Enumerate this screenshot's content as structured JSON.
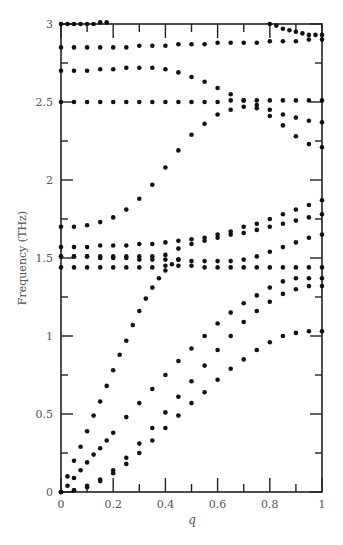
{
  "chart_data": {
    "type": "scatter",
    "title": "",
    "xlabel": "q",
    "ylabel": "Frequency (THz)",
    "xlim": [
      0,
      1
    ],
    "ylim": [
      0,
      3
    ],
    "grid": false,
    "legend": null,
    "x_ticks": [
      0,
      0.2,
      0.4,
      0.6,
      0.8,
      1
    ],
    "x_tick_labels": [
      "0",
      "0.2",
      "0.4",
      "0.6",
      "0.8",
      "1"
    ],
    "x_minor_ticks": [
      0.1,
      0.3,
      0.5,
      0.7,
      0.9
    ],
    "y_ticks": [
      0,
      0.5,
      1,
      1.5,
      2,
      2.5,
      3
    ],
    "y_tick_labels": [
      "0",
      "0.5",
      "1",
      "1.5",
      "2",
      "2.5",
      "3"
    ],
    "y_minor_ticks": [
      0.25,
      0.75,
      1.25,
      1.75,
      2.25,
      2.75
    ],
    "marker_color": "#111111",
    "series": [
      {
        "name": "branch-1",
        "x": [
          0,
          0.025,
          0.05,
          0.075,
          0.1,
          0.125,
          0.15,
          0.175
        ],
        "y": [
          3.0,
          3.0,
          3.0,
          3.0,
          3.0,
          3.0,
          3.01,
          3.01
        ]
      },
      {
        "name": "branch-2",
        "x": [
          0.8,
          0.825,
          0.85,
          0.875,
          0.9,
          0.925,
          0.95,
          0.975,
          1.0
        ],
        "y": [
          3.0,
          2.99,
          2.97,
          2.96,
          2.95,
          2.94,
          2.93,
          2.93,
          2.93
        ]
      },
      {
        "name": "branch-3",
        "x": [
          0,
          0.05,
          0.1,
          0.15,
          0.2,
          0.25,
          0.3,
          0.35,
          0.4,
          0.45,
          0.5,
          0.55,
          0.6,
          0.65,
          0.7,
          0.75,
          0.8,
          0.85,
          0.9,
          0.95,
          1.0
        ],
        "y": [
          2.85,
          2.85,
          2.85,
          2.85,
          2.85,
          2.85,
          2.86,
          2.86,
          2.86,
          2.87,
          2.87,
          2.87,
          2.88,
          2.88,
          2.88,
          2.88,
          2.89,
          2.89,
          2.89,
          2.9,
          2.9
        ]
      },
      {
        "name": "branch-4",
        "x": [
          0,
          0.05,
          0.1,
          0.15,
          0.2,
          0.25,
          0.3,
          0.35,
          0.4,
          0.45,
          0.5,
          0.55,
          0.6,
          0.65,
          0.7,
          0.75,
          0.8,
          0.85,
          0.9,
          0.95,
          1.0
        ],
        "y": [
          2.7,
          2.7,
          2.7,
          2.71,
          2.71,
          2.72,
          2.72,
          2.72,
          2.71,
          2.69,
          2.66,
          2.63,
          2.59,
          2.55,
          2.51,
          2.48,
          2.45,
          2.42,
          2.4,
          2.38,
          2.37
        ]
      },
      {
        "name": "branch-5",
        "x": [
          0,
          0.05,
          0.1,
          0.15,
          0.2,
          0.25,
          0.3,
          0.35,
          0.4,
          0.45,
          0.5,
          0.55,
          0.6,
          0.65,
          0.7,
          0.75,
          0.8,
          0.85,
          0.9,
          0.95,
          1.0
        ],
        "y": [
          2.5,
          2.5,
          2.5,
          2.5,
          2.5,
          2.5,
          2.5,
          2.5,
          2.5,
          2.5,
          2.5,
          2.5,
          2.5,
          2.51,
          2.51,
          2.51,
          2.51,
          2.51,
          2.51,
          2.51,
          2.51
        ]
      },
      {
        "name": "branch-6",
        "x": [
          0,
          0.05,
          0.1,
          0.15,
          0.2,
          0.25,
          0.3,
          0.35,
          0.4,
          0.45,
          0.5,
          0.55,
          0.6,
          0.65,
          0.7,
          0.75,
          0.8,
          0.85,
          0.9,
          0.95,
          1.0
        ],
        "y": [
          1.7,
          1.7,
          1.71,
          1.73,
          1.76,
          1.81,
          1.88,
          1.97,
          2.08,
          2.19,
          2.29,
          2.36,
          2.42,
          2.45,
          2.47,
          2.46,
          2.41,
          2.35,
          2.28,
          2.23,
          2.21
        ]
      },
      {
        "name": "branch-7",
        "x": [
          0,
          0.05,
          0.1,
          0.15,
          0.2,
          0.25,
          0.3,
          0.35,
          0.4,
          0.45,
          0.5,
          0.55,
          0.6,
          0.65,
          0.7,
          0.75,
          0.8,
          0.85,
          0.9,
          0.95,
          1.0
        ],
        "y": [
          1.57,
          1.57,
          1.57,
          1.58,
          1.58,
          1.58,
          1.59,
          1.59,
          1.6,
          1.61,
          1.62,
          1.63,
          1.65,
          1.67,
          1.7,
          1.72,
          1.75,
          1.78,
          1.81,
          1.84,
          1.87
        ]
      },
      {
        "name": "branch-8",
        "x": [
          0,
          0.05,
          0.1,
          0.15,
          0.2,
          0.25,
          0.3,
          0.35,
          0.4,
          0.45,
          0.5,
          0.55,
          0.6,
          0.65,
          0.7,
          0.75,
          0.8,
          0.85,
          0.9,
          0.95,
          1.0
        ],
        "y": [
          1.51,
          1.51,
          1.51,
          1.51,
          1.51,
          1.51,
          1.51,
          1.51,
          1.52,
          1.56,
          1.59,
          1.61,
          1.63,
          1.65,
          1.66,
          1.68,
          1.7,
          1.72,
          1.74,
          1.76,
          1.78
        ]
      },
      {
        "name": "branch-9",
        "x": [
          0,
          0.05,
          0.1,
          0.15,
          0.2,
          0.25,
          0.3,
          0.35,
          0.4,
          0.45,
          0.5,
          0.55,
          0.6,
          0.65,
          0.7,
          0.75,
          0.8,
          0.85,
          0.9,
          0.95,
          1.0
        ],
        "y": [
          1.51,
          1.51,
          1.51,
          1.5,
          1.5,
          1.5,
          1.49,
          1.49,
          1.49,
          1.49,
          1.48,
          1.48,
          1.48,
          1.48,
          1.49,
          1.51,
          1.54,
          1.57,
          1.6,
          1.63,
          1.65
        ]
      },
      {
        "name": "branch-10",
        "x": [
          0,
          0.05,
          0.1,
          0.15,
          0.2,
          0.25,
          0.3,
          0.35,
          0.4,
          0.45,
          0.5,
          0.55,
          0.6,
          0.65,
          0.7,
          0.75,
          0.8,
          0.85,
          0.9,
          0.95,
          1.0
        ],
        "y": [
          1.44,
          1.44,
          1.44,
          1.44,
          1.44,
          1.44,
          1.44,
          1.44,
          1.45,
          1.45,
          1.45,
          1.44,
          1.44,
          1.44,
          1.44,
          1.44,
          1.44,
          1.44,
          1.44,
          1.44,
          1.44
        ]
      },
      {
        "name": "branch-11",
        "x": [
          0,
          0.025,
          0.05,
          0.075,
          0.1,
          0.125,
          0.15,
          0.175,
          0.2,
          0.225,
          0.25,
          0.275,
          0.3,
          0.325,
          0.35,
          0.375,
          0.4,
          0.425,
          0.45
        ],
        "y": [
          0,
          0.1,
          0.2,
          0.29,
          0.39,
          0.49,
          0.58,
          0.68,
          0.78,
          0.88,
          0.97,
          1.07,
          1.16,
          1.24,
          1.31,
          1.37,
          1.42,
          1.46,
          1.49
        ]
      },
      {
        "name": "branch-12",
        "x": [
          0,
          0.025,
          0.05,
          0.075,
          0.1,
          0.125,
          0.15,
          0.175,
          0.2,
          0.25,
          0.3,
          0.35,
          0.4,
          0.45,
          0.5,
          0.55,
          0.6,
          0.65,
          0.7,
          0.75,
          0.8,
          0.85,
          0.9,
          0.95,
          1.0
        ],
        "y": [
          0,
          0.04,
          0.09,
          0.14,
          0.19,
          0.24,
          0.28,
          0.33,
          0.38,
          0.48,
          0.57,
          0.66,
          0.75,
          0.84,
          0.92,
          1.0,
          1.08,
          1.15,
          1.21,
          1.26,
          1.31,
          1.35,
          1.37,
          1.37,
          1.37
        ]
      },
      {
        "name": "branch-13",
        "x": [
          0,
          0.05,
          0.1,
          0.15,
          0.2,
          0.25,
          0.3,
          0.35,
          0.4,
          0.45,
          0.5,
          0.55,
          0.6,
          0.65,
          0.7,
          0.75,
          0.8,
          0.85,
          0.9,
          0.95,
          1.0
        ],
        "y": [
          0,
          0.01,
          0.04,
          0.08,
          0.14,
          0.22,
          0.31,
          0.41,
          0.51,
          0.61,
          0.71,
          0.81,
          0.91,
          1.0,
          1.09,
          1.16,
          1.22,
          1.27,
          1.3,
          1.32,
          1.32
        ]
      },
      {
        "name": "branch-14",
        "x": [
          0,
          0.05,
          0.1,
          0.15,
          0.2,
          0.25,
          0.3,
          0.35,
          0.4,
          0.45,
          0.5,
          0.55,
          0.6,
          0.65,
          0.7,
          0.75,
          0.8,
          0.85,
          0.9,
          0.95,
          1.0
        ],
        "y": [
          0,
          0.01,
          0.03,
          0.07,
          0.12,
          0.18,
          0.25,
          0.33,
          0.41,
          0.49,
          0.57,
          0.64,
          0.72,
          0.79,
          0.85,
          0.91,
          0.96,
          1.0,
          1.02,
          1.03,
          1.03
        ]
      }
    ]
  }
}
